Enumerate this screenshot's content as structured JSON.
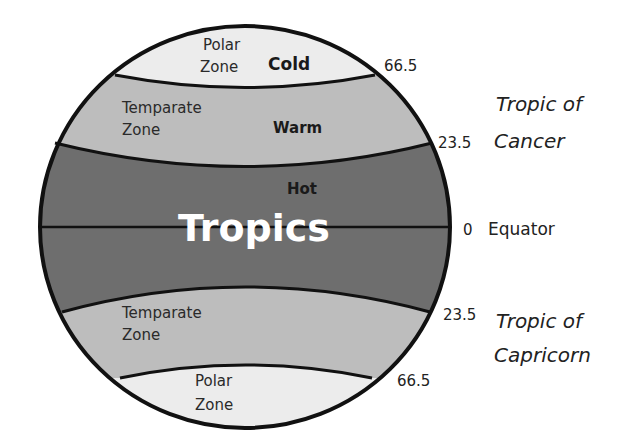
{
  "diagram": {
    "colors": {
      "polar": "#ececec",
      "temperate": "#bdbdbd",
      "tropics": "#6e6e6e",
      "outline": "#111111",
      "tropics_label": "#ffffff"
    },
    "zones": {
      "north_polar": {
        "name_line1": "Polar",
        "name_line2": "Zone",
        "temperature": "Cold"
      },
      "north_temperate": {
        "name_line1": "Temparate",
        "name_line2": "Zone",
        "temperature": "Warm"
      },
      "tropics": {
        "name": "Tropics",
        "temperature": "Hot"
      },
      "south_temperate": {
        "name_line1": "Temparate",
        "name_line2": "Zone"
      },
      "south_polar": {
        "name_line1": "Polar",
        "name_line2": "Zone"
      }
    },
    "latitudes": {
      "arctic": {
        "degrees": "66.5"
      },
      "cancer": {
        "degrees": "23.5",
        "name_line1": "Tropic of",
        "name_line2": "Cancer"
      },
      "equator": {
        "degrees": "0",
        "name": "Equator"
      },
      "capricorn": {
        "degrees": "23.5",
        "name_line1": "Tropic of",
        "name_line2": "Capricorn"
      },
      "antarctic": {
        "degrees": "66.5"
      }
    }
  }
}
